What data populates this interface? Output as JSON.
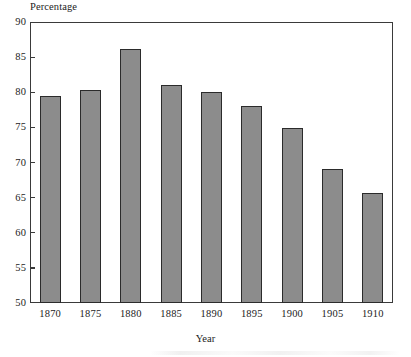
{
  "chart_data": {
    "type": "bar",
    "title": "",
    "subtitle": "",
    "xlabel": "Year",
    "ylabel": "Percentage",
    "categories": [
      "1870",
      "1875",
      "1880",
      "1885",
      "1890",
      "1895",
      "1900",
      "1905",
      "1910"
    ],
    "values": [
      79.4,
      80.3,
      86.1,
      81.0,
      80.0,
      78.0,
      74.9,
      69.1,
      65.7
    ],
    "ylim": [
      50,
      90
    ],
    "y_ticks": [
      50,
      55,
      60,
      65,
      70,
      75,
      80,
      85,
      90
    ],
    "y_tick_labels": [
      "50",
      "55",
      "60",
      "65",
      "70",
      "75",
      "80",
      "85",
      "90"
    ],
    "x_tick_labels": [
      "1870",
      "1875",
      "1880",
      "1885",
      "1890",
      "1895",
      "1900",
      "1905",
      "1910"
    ],
    "grid": false,
    "legend": null,
    "legend_position": "none",
    "bar_fill_color": "#8c8c8c",
    "bar_edge_color": "#2b2b2b",
    "axis_color": "#3a3a3a",
    "background_color": "#ffffff",
    "annotations": []
  },
  "axes": {
    "y_title": "Percentage",
    "x_title": "Year"
  }
}
